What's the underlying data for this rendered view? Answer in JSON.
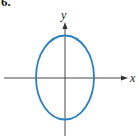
{
  "problem_number": "6.",
  "axes": {
    "x_label": "x",
    "y_label": "y"
  },
  "curve": {
    "type": "ellipse",
    "orientation": "vertical",
    "color": "#2a7fc1"
  },
  "axis_color": "#333333"
}
